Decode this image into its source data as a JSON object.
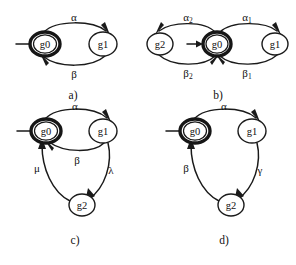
{
  "figure": {
    "background_color": "#ffffff",
    "stroke_color": "#1a1a1a",
    "node_fill": "#ffffff"
  },
  "panels": [
    {
      "id": "a",
      "caption": "a)",
      "start_state": "g0",
      "nodes": [
        {
          "id": "g0",
          "label": "g0",
          "emphasis": "double",
          "cx": 45,
          "cy": 44,
          "rx": 15,
          "ry": 12
        },
        {
          "id": "g1",
          "label": "g1",
          "emphasis": "single",
          "cx": 103,
          "cy": 44,
          "rx": 14,
          "ry": 12
        }
      ],
      "edges": [
        {
          "from": "g0",
          "to": "g1",
          "label": "α",
          "label_x": 74,
          "label_y": 17
        },
        {
          "from": "g1",
          "to": "g0",
          "label": "β",
          "label_x": 74,
          "label_y": 74
        }
      ]
    },
    {
      "id": "b",
      "caption": "b)",
      "start_state": "g0",
      "nodes": [
        {
          "id": "g2",
          "label": "g2",
          "emphasis": "single",
          "cx": 160,
          "cy": 44,
          "rx": 13,
          "ry": 11
        },
        {
          "id": "g0",
          "label": "g0",
          "emphasis": "double",
          "cx": 217,
          "cy": 44,
          "rx": 14,
          "ry": 12
        },
        {
          "id": "g1",
          "label": "g1",
          "emphasis": "single",
          "cx": 275,
          "cy": 44,
          "rx": 13,
          "ry": 11
        }
      ],
      "edges": [
        {
          "from": "g0",
          "to": "g2",
          "label": "α",
          "sub": "2",
          "label_x": 188,
          "label_y": 17
        },
        {
          "from": "g2",
          "to": "g0",
          "label": "β",
          "sub": "2",
          "label_x": 188,
          "label_y": 73
        },
        {
          "from": "g0",
          "to": "g1",
          "label": "α",
          "sub": "1",
          "label_x": 247,
          "label_y": 17
        },
        {
          "from": "g1",
          "to": "g0",
          "label": "β",
          "sub": "1",
          "label_x": 247,
          "label_y": 73
        }
      ]
    },
    {
      "id": "c",
      "caption": "c)",
      "start_state": "g0",
      "nodes": [
        {
          "id": "g0",
          "label": "g0",
          "emphasis": "double",
          "cx": 46,
          "cy": 131,
          "rx": 15,
          "ry": 12
        },
        {
          "id": "g1",
          "label": "g1",
          "emphasis": "single",
          "cx": 103,
          "cy": 131,
          "rx": 14,
          "ry": 12
        },
        {
          "id": "g2",
          "label": "g2",
          "emphasis": "single",
          "cx": 82,
          "cy": 205,
          "rx": 13,
          "ry": 11
        }
      ],
      "edges": [
        {
          "from": "g0",
          "to": "g1",
          "label": "α",
          "label_x": 75,
          "label_y": 106
        },
        {
          "from": "g1",
          "to": "g0",
          "label": "β",
          "label_x": 77,
          "label_y": 160
        },
        {
          "from": "g1",
          "to": "g2",
          "label": "λ",
          "label_x": 111,
          "label_y": 170
        },
        {
          "from": "g2",
          "to": "g0",
          "label": "μ",
          "label_x": 37,
          "label_y": 168
        }
      ]
    },
    {
      "id": "d",
      "caption": "d)",
      "start_state": "g0",
      "nodes": [
        {
          "id": "g0",
          "label": "g0",
          "emphasis": "double",
          "cx": 195,
          "cy": 131,
          "rx": 15,
          "ry": 12
        },
        {
          "id": "g1",
          "label": "g1",
          "emphasis": "single",
          "cx": 252,
          "cy": 131,
          "rx": 14,
          "ry": 12
        },
        {
          "id": "g2",
          "label": "g2",
          "emphasis": "single",
          "cx": 231,
          "cy": 205,
          "rx": 13,
          "ry": 11
        }
      ],
      "edges": [
        {
          "from": "g0",
          "to": "g1",
          "label": "α",
          "label_x": 224,
          "label_y": 106
        },
        {
          "from": "g1",
          "to": "g2",
          "label": "γ",
          "label_x": 260,
          "label_y": 170
        },
        {
          "from": "g2",
          "to": "g0",
          "label": "β",
          "label_x": 186,
          "label_y": 168
        }
      ]
    }
  ]
}
